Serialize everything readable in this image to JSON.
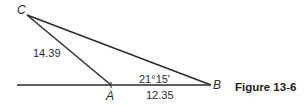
{
  "figure": {
    "caption": "Figure 13-6",
    "vertices": {
      "A": "A",
      "B": "B",
      "C": "C"
    },
    "measurements": {
      "side_CA": "14.39",
      "side_AB": "12.35",
      "angle_B": "21°15'"
    },
    "colors": {
      "line": "#2a2a2a",
      "background": "#ffffff"
    }
  }
}
